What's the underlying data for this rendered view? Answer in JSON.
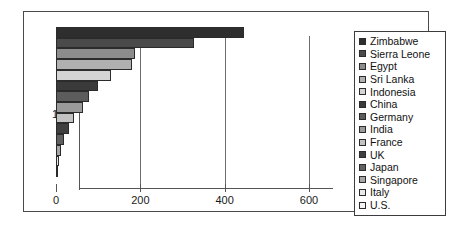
{
  "chart_data": {
    "type": "bar",
    "orientation": "horizontal",
    "title": "",
    "xlabel": "",
    "ylabel": "",
    "xlim": [
      0,
      600
    ],
    "xticks": [
      0,
      200,
      400,
      600
    ],
    "xtick_labels": [
      "0",
      "200",
      "400",
      "600"
    ],
    "ytick_labels": [
      "1"
    ],
    "grid": true,
    "legend_position": "right",
    "categories": [
      "1"
    ],
    "series": [
      {
        "name": "Zimbabwe",
        "values": [
          446
        ],
        "color": "#2e2e2e"
      },
      {
        "name": "Sierra Leone",
        "values": [
          327
        ],
        "color": "#4a4a4a"
      },
      {
        "name": "Egypt",
        "values": [
          187
        ],
        "color": "#8c8c8c"
      },
      {
        "name": "Sri Lanka",
        "values": [
          180
        ],
        "color": "#b0b0b0"
      },
      {
        "name": "Indonesia",
        "values": [
          130
        ],
        "color": "#d4d4d4"
      },
      {
        "name": "China",
        "values": [
          100
        ],
        "color": "#3a3a3a"
      },
      {
        "name": "Germany",
        "values": [
          78
        ],
        "color": "#5c5c5c"
      },
      {
        "name": "India",
        "values": [
          64
        ],
        "color": "#9a9a9a"
      },
      {
        "name": "France",
        "values": [
          43
        ],
        "color": "#c2c2c2"
      },
      {
        "name": "UK",
        "values": [
          31
        ],
        "color": "#3f3f3f"
      },
      {
        "name": "Japan",
        "values": [
          18
        ],
        "color": "#606060"
      },
      {
        "name": "Singapore",
        "values": [
          12
        ],
        "color": "#a6a6a6"
      },
      {
        "name": "Italy",
        "values": [
          8
        ],
        "color": "#e8e8e8"
      },
      {
        "name": "U.S.",
        "values": [
          5
        ],
        "color": "#f4f4f4"
      }
    ]
  },
  "colors": {
    "frame": "#4a4a4a",
    "axis": "#555555",
    "gridline": "#6d6d6d",
    "text": "#1a1a1a",
    "background": "#ffffff"
  }
}
